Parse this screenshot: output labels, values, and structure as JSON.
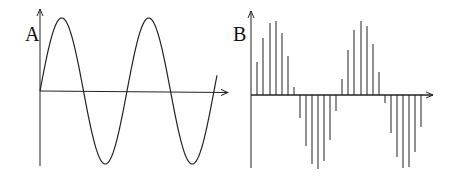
{
  "panels": [
    {
      "label": "A",
      "description": "Continuous (analog) sine wave",
      "axis": {
        "x0": 40,
        "y_axis_top": 9,
        "y_axis_bottom": 166,
        "baseline_y": 91,
        "x_end": 228
      },
      "wave": {
        "start_x": 40,
        "end_x": 217,
        "period_px": 87,
        "amplitude_px": 73
      }
    },
    {
      "label": "B",
      "description": "Sampled (discrete) sine wave shown as vertical stems",
      "axis": {
        "x0": 251,
        "y_axis_top": 11,
        "y_axis_bottom": 168,
        "baseline_y": 95,
        "x_end": 433
      },
      "stems": [
        {
          "x": 257,
          "y": 62
        },
        {
          "x": 263,
          "y": 38
        },
        {
          "x": 270,
          "y": 23
        },
        {
          "x": 276,
          "y": 21
        },
        {
          "x": 282,
          "y": 33
        },
        {
          "x": 288,
          "y": 56
        },
        {
          "x": 294,
          "y": 87
        },
        {
          "x": 300,
          "y": 118
        },
        {
          "x": 306,
          "y": 146
        },
        {
          "x": 312,
          "y": 164
        },
        {
          "x": 318,
          "y": 169
        },
        {
          "x": 324,
          "y": 161
        },
        {
          "x": 330,
          "y": 140
        },
        {
          "x": 336,
          "y": 111
        },
        {
          "x": 342,
          "y": 79
        },
        {
          "x": 348,
          "y": 50
        },
        {
          "x": 354,
          "y": 30
        },
        {
          "x": 361,
          "y": 21
        },
        {
          "x": 367,
          "y": 26
        },
        {
          "x": 373,
          "y": 44
        },
        {
          "x": 379,
          "y": 72
        },
        {
          "x": 385,
          "y": 103
        },
        {
          "x": 391,
          "y": 133
        },
        {
          "x": 397,
          "y": 157
        },
        {
          "x": 403,
          "y": 168
        },
        {
          "x": 409,
          "y": 167
        },
        {
          "x": 415,
          "y": 152
        },
        {
          "x": 421,
          "y": 127
        }
      ]
    }
  ],
  "colors": {
    "line": "#222222",
    "background": "#ffffff"
  }
}
